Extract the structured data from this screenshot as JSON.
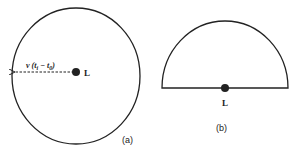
{
  "figure": {
    "panel_a": {
      "caption": "(a)",
      "point_label": "L",
      "radius_label": "v (t",
      "radius_sub1": "i",
      "radius_mid": " − t",
      "radius_sub2": "0",
      "radius_close": ")",
      "shape": "circle"
    },
    "panel_b": {
      "caption": "(b)",
      "point_label": "L",
      "shape": "semicircle"
    },
    "colors": {
      "stroke": "#222222",
      "background": "#ffffff"
    }
  }
}
